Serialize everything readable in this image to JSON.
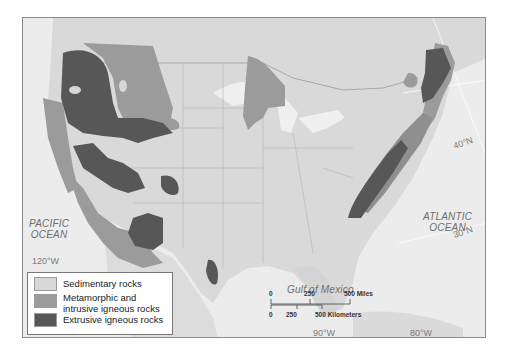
{
  "map": {
    "colors": {
      "background_ocean": "#ececec",
      "land": "#d9d9d9",
      "sedimentary": "#d6d6d6",
      "metamorphic_intrusive": "#999999",
      "extrusive": "#555555",
      "frame": "#8a8a8a"
    },
    "labels": {
      "pacific": "PACIFIC\nOCEAN",
      "atlantic": "ATLANTIC\nOCEAN",
      "gulf": "Gulf of Mexico"
    },
    "coordinates": {
      "lon_120": "120°W",
      "lon_90": "90°W",
      "lon_80": "80°W",
      "lat_40": "40°N",
      "lat_30": "30°N"
    }
  },
  "legend": {
    "items": [
      {
        "label": "Sedimentary rocks",
        "color": "#d8d8d8"
      },
      {
        "label": "Metamorphic and\nintrusive igneous rocks",
        "color": "#9b9b9b"
      },
      {
        "label": "Extrusive igneous rocks",
        "color": "#575757"
      }
    ]
  },
  "scale_bar": {
    "miles": {
      "ticks": [
        "0",
        "250",
        "500 Miles"
      ]
    },
    "kilometers": {
      "ticks": [
        "0",
        "250",
        "500 Kilometers"
      ]
    }
  }
}
